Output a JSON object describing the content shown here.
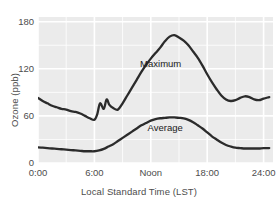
{
  "chart_data": {
    "type": "line",
    "title": "",
    "xlabel": "Local Standard Time (LST)",
    "ylabel": "Ozone (ppb)",
    "xlim": [
      0,
      25
    ],
    "ylim": [
      0,
      186
    ],
    "grid": true,
    "legend_position": "inline-annotation",
    "panel_background": "#ebebeb",
    "grid_color": "#ffffff",
    "line_color": "#2b2b2b",
    "xtick_values": [
      0,
      6,
      12,
      18,
      24
    ],
    "xtick_labels": [
      "0:00",
      "6:00",
      "Noon",
      "18:00",
      "24:00"
    ],
    "ytick_values": [
      0,
      60,
      120,
      180
    ],
    "ytick_labels": [
      "0",
      "60",
      "120",
      "180"
    ],
    "annotations": [
      {
        "text": "Maximum",
        "x": 13.2,
        "y": 126
      },
      {
        "text": "Average",
        "x": 14.0,
        "y": 44
      }
    ],
    "series": [
      {
        "name": "Maximum",
        "x": [
          0.0,
          0.5,
          1.0,
          1.5,
          2.0,
          2.5,
          3.0,
          3.5,
          4.0,
          4.5,
          5.0,
          5.5,
          6.0,
          6.3,
          6.6,
          7.0,
          7.3,
          7.6,
          8.0,
          8.5,
          9.0,
          9.5,
          10.0,
          10.5,
          11.0,
          11.5,
          12.0,
          12.5,
          13.0,
          13.5,
          14.0,
          14.5,
          15.0,
          15.5,
          16.0,
          16.5,
          17.0,
          17.5,
          18.0,
          18.5,
          19.0,
          19.5,
          20.0,
          20.5,
          21.0,
          21.5,
          22.0,
          22.5,
          23.0,
          23.5,
          24.0,
          24.6
        ],
        "y": [
          83,
          79,
          76,
          73,
          71,
          69,
          68,
          66,
          65,
          63,
          60,
          57,
          55,
          62,
          76,
          69,
          81,
          74,
          70,
          68,
          76,
          86,
          96,
          106,
          116,
          125,
          133,
          140,
          147,
          155,
          161,
          163,
          160,
          156,
          150,
          142,
          134,
          124,
          113,
          103,
          94,
          86,
          81,
          79,
          80,
          83,
          85,
          84,
          81,
          80,
          82,
          84
        ]
      },
      {
        "name": "Average",
        "x": [
          0.0,
          0.5,
          1.0,
          1.5,
          2.0,
          2.5,
          3.0,
          3.5,
          4.0,
          4.5,
          5.0,
          5.5,
          6.0,
          6.5,
          7.0,
          7.5,
          8.0,
          8.5,
          9.0,
          9.5,
          10.0,
          10.5,
          11.0,
          11.5,
          12.0,
          12.5,
          13.0,
          13.5,
          14.0,
          14.5,
          15.0,
          15.5,
          16.0,
          16.5,
          17.0,
          17.5,
          18.0,
          18.5,
          19.0,
          19.5,
          20.0,
          20.5,
          21.0,
          21.5,
          22.0,
          22.5,
          23.0,
          23.5,
          24.0,
          24.6
        ],
        "y": [
          20,
          19.5,
          19,
          18.5,
          18,
          17.5,
          17,
          16.5,
          16,
          15.5,
          15,
          15,
          15,
          16,
          18,
          21,
          24,
          28,
          32,
          36,
          40,
          44,
          48,
          51,
          54,
          56,
          57,
          57.5,
          58,
          58,
          57.5,
          57,
          55,
          52,
          48,
          44,
          39,
          34,
          30,
          26,
          23,
          21,
          19.5,
          19,
          18.5,
          18.5,
          18.5,
          18.5,
          19,
          19
        ]
      }
    ]
  }
}
